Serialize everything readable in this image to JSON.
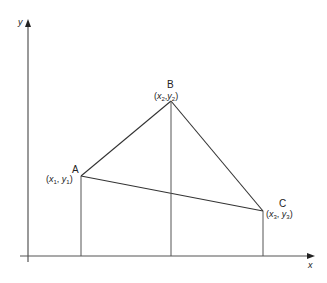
{
  "diagram": {
    "axes": {
      "x_label": "x",
      "y_label": "y"
    },
    "points": [
      {
        "name": "A",
        "x_var": "x",
        "x_sub": "1",
        "y_var": "y",
        "y_sub": "1"
      },
      {
        "name": "B",
        "x_var": "x",
        "x_sub": "2",
        "y_var": "y",
        "y_sub": "2"
      },
      {
        "name": "C",
        "x_var": "x",
        "x_sub": "3",
        "y_var": "y",
        "y_sub": "3"
      }
    ],
    "colors": {
      "line": "#333333",
      "axis": "#555555"
    }
  }
}
